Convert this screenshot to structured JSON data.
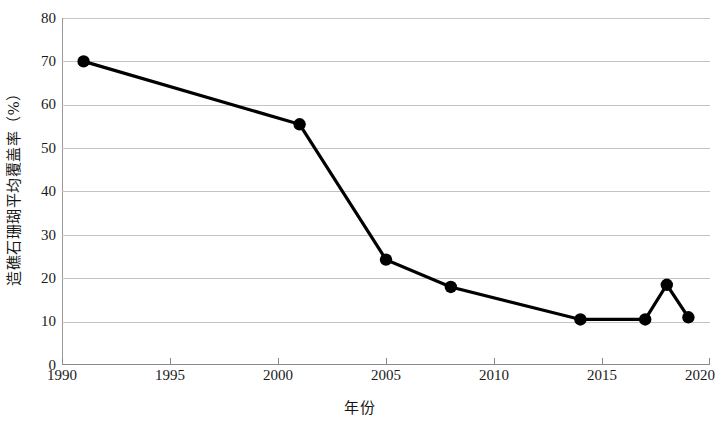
{
  "chart_data": {
    "type": "line",
    "title": "",
    "subtitle": "",
    "xlabel": "年份",
    "ylabel": "造礁石珊瑚平均覆盖率（%）",
    "xlim": [
      1990,
      2020
    ],
    "ylim": [
      0,
      80
    ],
    "x_ticks": [
      1990,
      1995,
      2000,
      2005,
      2010,
      2015,
      2020
    ],
    "y_ticks": [
      0,
      10,
      20,
      30,
      40,
      50,
      60,
      70,
      80
    ],
    "grid": "horizontal",
    "legend": "none",
    "series": [
      {
        "name": "造礁石珊瑚平均覆盖率",
        "x": [
          1991,
          2001,
          2005,
          2008,
          2014,
          2017,
          2018,
          2019
        ],
        "values": [
          70,
          55.5,
          24.3,
          18,
          10.5,
          10.5,
          18.5,
          11
        ],
        "line_color": "#000000",
        "marker": "circle",
        "marker_color": "#000000"
      }
    ],
    "grid_color": "#c6c3bd",
    "axis_color": "#8d8a83"
  },
  "axes": {
    "y_title": "造礁石珊瑚平均覆盖率（%）",
    "x_title": "年份",
    "y_tick_labels": [
      "80",
      "70",
      "60",
      "50",
      "40",
      "30",
      "20",
      "10",
      "0"
    ],
    "x_tick_labels": [
      "1990",
      "1995",
      "2000",
      "2005",
      "2010",
      "2015",
      "2020"
    ]
  }
}
